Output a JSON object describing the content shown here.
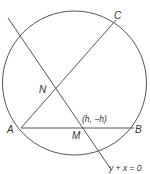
{
  "diagram": {
    "type": "geometry",
    "colors": {
      "stroke": "#555555",
      "label": "#333333",
      "background": "#ffffff"
    },
    "points": {
      "A": {
        "label": "A"
      },
      "B": {
        "label": "B"
      },
      "C": {
        "label": "C"
      },
      "N": {
        "label": "N"
      },
      "M": {
        "label": "M",
        "coord_label": "(h, −h)"
      }
    },
    "line_label": "y + x = 0"
  }
}
